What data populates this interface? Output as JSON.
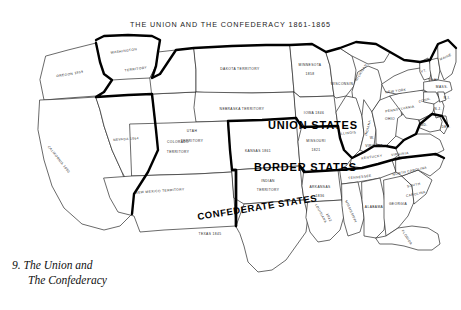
{
  "map": {
    "title": "THE UNION AND THE CONFEDERACY 1861-1865",
    "caption_number": "9.",
    "caption_line1": "The Union and",
    "caption_line2": "The Confederacy",
    "colors": {
      "ink": "#1d1d1d",
      "heavy_border": "#000000",
      "background": "#ffffff"
    },
    "region_labels": [
      {
        "name": "union-states",
        "text": "UNION STATES"
      },
      {
        "name": "border-states",
        "text": "BORDER STATES"
      },
      {
        "name": "confederate-states",
        "text": "CONFEDERATE STATES"
      }
    ],
    "state_labels": [
      {
        "name": "washington-territory",
        "line1": "WASHINGTON",
        "line2": "TERRITORY"
      },
      {
        "name": "oregon",
        "line1": "OREGON 1859"
      },
      {
        "name": "california",
        "line1": "CALIFORNIA 1850"
      },
      {
        "name": "nevada",
        "line1": "NEVADA 1864"
      },
      {
        "name": "utah-territory",
        "line1": "UTAH",
        "line2": "TERRITORY"
      },
      {
        "name": "dakota-territory",
        "line1": "DAKOTA  TERRITORY"
      },
      {
        "name": "nebraska-territory",
        "line1": "NEBRASKA  TERRITORY"
      },
      {
        "name": "colorado-territory",
        "line1": "COLORADO",
        "line2": "TERRITORY"
      },
      {
        "name": "kansas",
        "line1": "KANSAS 1861"
      },
      {
        "name": "new-mexico-territory",
        "line1": "NEW MEXICO TERRITORY"
      },
      {
        "name": "indian-territory",
        "line1": "INDIAN",
        "line2": "TERRITORY"
      },
      {
        "name": "texas",
        "line1": "TEXAS 1845"
      },
      {
        "name": "minnesota",
        "line1": "MINNESOTA",
        "line2": "1858"
      },
      {
        "name": "wisconsin",
        "line1": "WISCONSIN"
      },
      {
        "name": "michigan",
        "line1": "MICHIGAN"
      },
      {
        "name": "iowa",
        "line1": "IOWA 1846"
      },
      {
        "name": "illinois",
        "line1": "ILLINOIS"
      },
      {
        "name": "indiana",
        "line1": "INDIANA"
      },
      {
        "name": "ohio",
        "line1": "OHIO"
      },
      {
        "name": "missouri",
        "line1": "MISSOURI",
        "line2": "1821"
      },
      {
        "name": "kentucky",
        "line1": "KENTUCKY"
      },
      {
        "name": "tennessee",
        "line1": "TENNESSEE"
      },
      {
        "name": "arkansas",
        "line1": "ARKANSAS",
        "line2": "1836"
      },
      {
        "name": "louisiana",
        "line1": "LOUISIANA",
        "line2": "1812"
      },
      {
        "name": "mississippi",
        "line1": "MISSISSIPPI"
      },
      {
        "name": "alabama",
        "line1": "ALABAMA"
      },
      {
        "name": "georgia",
        "line1": "GEORGIA"
      },
      {
        "name": "florida",
        "line1": "FLORIDA"
      },
      {
        "name": "south-carolina",
        "line1": "SOUTH",
        "line2": "CAROLINA"
      },
      {
        "name": "north-carolina",
        "line1": "NORTH CAROLINA"
      },
      {
        "name": "virginia",
        "line1": "VIRGINIA"
      },
      {
        "name": "west-virginia",
        "line1": "W.",
        "line2": "VIRGINIA"
      },
      {
        "name": "maryland",
        "line1": "MD."
      },
      {
        "name": "delaware",
        "line1": "DEL."
      },
      {
        "name": "pennsylvania",
        "line1": "PENNSYLVANIA"
      },
      {
        "name": "new-jersey",
        "line1": "N.J."
      },
      {
        "name": "new-york",
        "line1": "NEW YORK"
      },
      {
        "name": "connecticut",
        "line1": "CONN."
      },
      {
        "name": "rhode-island",
        "line1": "R.I."
      },
      {
        "name": "massachusetts",
        "line1": "MASS."
      },
      {
        "name": "vermont",
        "line1": "VT."
      },
      {
        "name": "new-hampshire",
        "line1": "N.H."
      },
      {
        "name": "maine",
        "line1": "MAINE"
      }
    ]
  }
}
